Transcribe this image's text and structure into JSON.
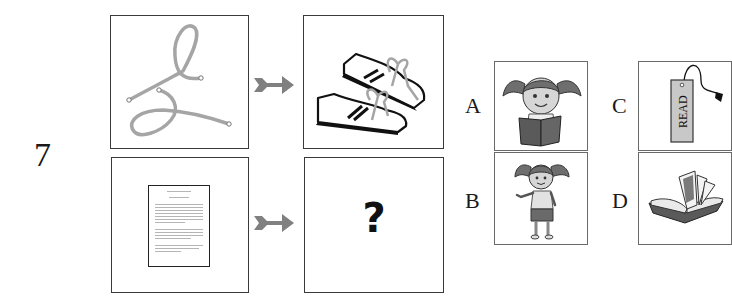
{
  "question": {
    "number": "7",
    "prompt_pairs": [
      {
        "source": {
          "icon": "shoelace-icon",
          "description": "untied shoelace"
        },
        "arrow": "arrow-right-icon",
        "target": {
          "icon": "sneakers-icon",
          "description": "pair of laced sneakers"
        }
      },
      {
        "source": {
          "icon": "document-page-icon",
          "description": "page of text"
        },
        "arrow": "arrow-right-icon",
        "target": {
          "text": "?",
          "description": "unknown answer"
        }
      }
    ]
  },
  "options": [
    {
      "label": "A",
      "icon": "girl-reading-book-icon",
      "description": "girl reading a book"
    },
    {
      "label": "B",
      "icon": "girl-standing-icon",
      "description": "girl standing"
    },
    {
      "label": "C",
      "icon": "bookmark-icon",
      "description": "bookmark",
      "text": "READ"
    },
    {
      "label": "D",
      "icon": "open-book-icon",
      "description": "open book"
    }
  ],
  "colors": {
    "border": "#3a3a3a",
    "arrow": "#7f7f7f",
    "lace": "#a9a9a9",
    "text": "#1a1a1a",
    "bookmark_fill": "#c8c8c8"
  }
}
